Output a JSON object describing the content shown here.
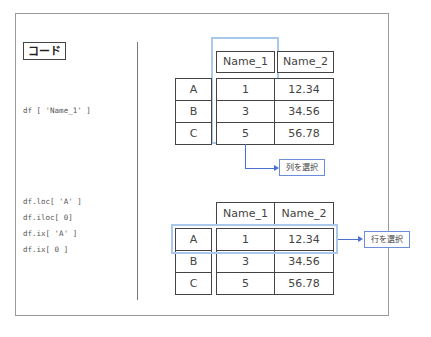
{
  "label": "コード",
  "top_section": {
    "code": "df [ 'Name_1' ]",
    "columns": [
      "Name_1",
      "Name_2"
    ],
    "index": [
      "A",
      "B",
      "C"
    ],
    "rows": [
      [
        "1",
        "12.34"
      ],
      [
        "3",
        "34.56"
      ],
      [
        "5",
        "56.78"
      ]
    ],
    "annotation": "列を選択"
  },
  "bottom_section": {
    "code_lines": [
      "df.loc[ 'A' ]",
      "df.iloc[ 0]",
      "df.ix[ 'A' ]",
      "df.ix[ 0 ]"
    ],
    "columns": [
      "Name_1",
      "Name_2"
    ],
    "index": [
      "A",
      "B",
      "C"
    ],
    "rows": [
      [
        "1",
        "12.34"
      ],
      [
        "3",
        "34.56"
      ],
      [
        "5",
        "56.78"
      ]
    ],
    "annotation": "行を選択"
  },
  "colors": {
    "highlight": "#a8c8ec",
    "arrow": "#4a6fd0",
    "border": "#444444"
  }
}
